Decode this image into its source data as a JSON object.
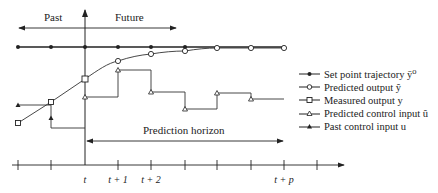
{
  "figure": {
    "type": "diagram",
    "labels": {
      "past": "Past",
      "future": "Future",
      "prediction_horizon": "Prediction horizon"
    },
    "time_axis": {
      "ticks": [
        "",
        "",
        "t",
        "t + 1",
        "t + 2",
        "",
        "",
        "",
        "t + p",
        ""
      ],
      "labels": {
        "t": "t",
        "t1": "t + 1",
        "t2": "t + 2",
        "tp": "t + p"
      }
    },
    "legend": [
      {
        "key": "setpoint",
        "label": "Set point trajectory ȳ⁰",
        "marker": "filled-circle"
      },
      {
        "key": "predicted_output",
        "label": "Predicted output ŷ",
        "marker": "open-circle"
      },
      {
        "key": "measured_output",
        "label": "Measured output y",
        "marker": "open-square"
      },
      {
        "key": "predicted_control",
        "label": "Predicted control input û",
        "marker": "open-triangle"
      },
      {
        "key": "past_control",
        "label": "Past control input u",
        "marker": "filled-triangle"
      }
    ],
    "series": {
      "setpoint": [
        [
          18,
          47
        ],
        [
          51,
          47
        ],
        [
          85,
          47
        ],
        [
          118,
          47
        ],
        [
          151,
          47
        ],
        [
          185,
          47
        ],
        [
          217,
          47
        ],
        [
          251,
          47
        ],
        [
          284,
          47
        ]
      ],
      "predicted_output": [
        [
          118,
          61
        ],
        [
          151,
          54
        ],
        [
          185,
          51
        ],
        [
          217,
          48
        ],
        [
          251,
          48
        ],
        [
          284,
          48
        ]
      ],
      "measured_output": [
        [
          18,
          123
        ],
        [
          51,
          102
        ],
        [
          85,
          79
        ]
      ],
      "predicted_control": [
        [
          85,
          97
        ],
        [
          118,
          70
        ],
        [
          151,
          92
        ],
        [
          185,
          109
        ],
        [
          217,
          93
        ],
        [
          251,
          99
        ]
      ],
      "past_control": [
        [
          18,
          105
        ],
        [
          51,
          118
        ]
      ]
    }
  }
}
